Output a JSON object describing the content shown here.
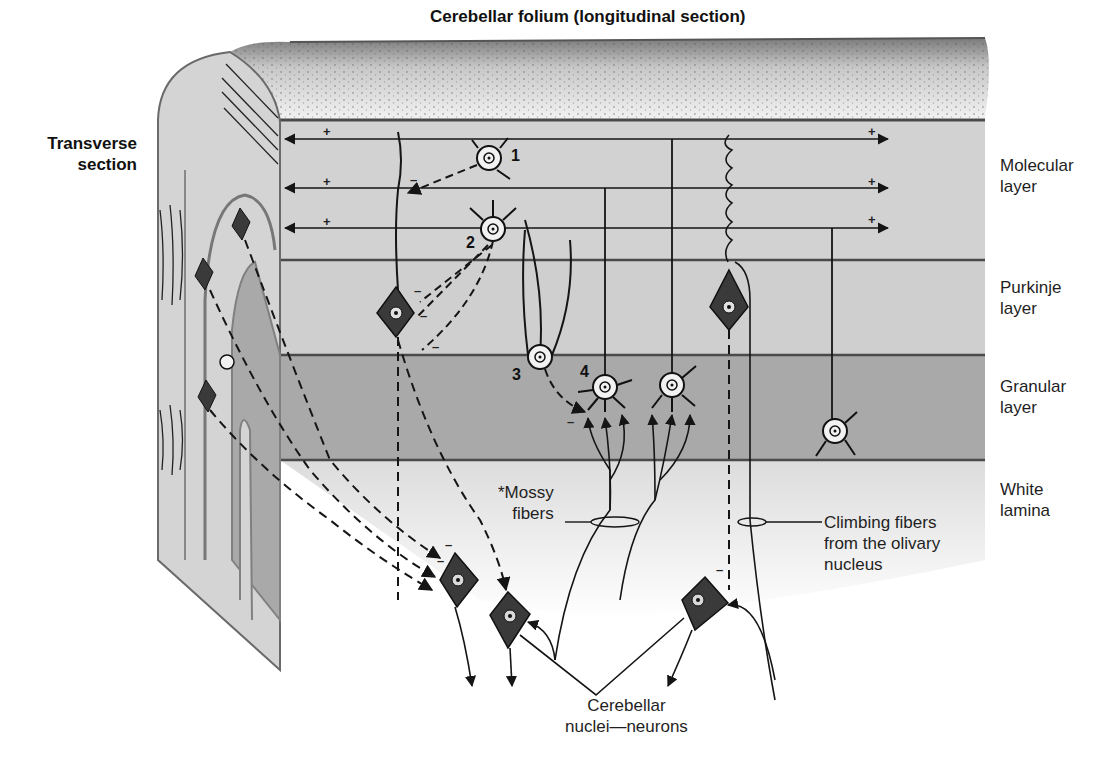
{
  "title": "Cerebellar folium (longitudinal section)",
  "side_title": "Transverse\nsection",
  "colors": {
    "background": "#ffffff",
    "molecular": "#d2d2d2",
    "purkinje": "#cfcfcf",
    "granular": "#a9a9a9",
    "white_lamina": "#e6e6e6",
    "surface_top": "#ececec",
    "boundary_line": "#4a4a4a",
    "purkinje_cell_fill": "#3a3a3a",
    "granule_cell_fill": "#f2f2f2",
    "line": "#151515"
  },
  "layers": [
    {
      "id": "molecular",
      "label": "Molecular\nlayer"
    },
    {
      "id": "purkinje",
      "label": "Purkinje\nlayer"
    },
    {
      "id": "granular",
      "label": "Granular\nlayer"
    },
    {
      "id": "white",
      "label": "White\nlamina"
    }
  ],
  "cell_numbers": [
    "1",
    "2",
    "3",
    "4"
  ],
  "signs": {
    "excitatory": "+",
    "inhibitory": "–"
  },
  "annotations": {
    "mossy": "*Mossy\nfibers",
    "climbing": "Climbing fibers\nfrom the olivary\nnucleus",
    "nuclei": "Cerebellar\nnuclei—neurons"
  }
}
